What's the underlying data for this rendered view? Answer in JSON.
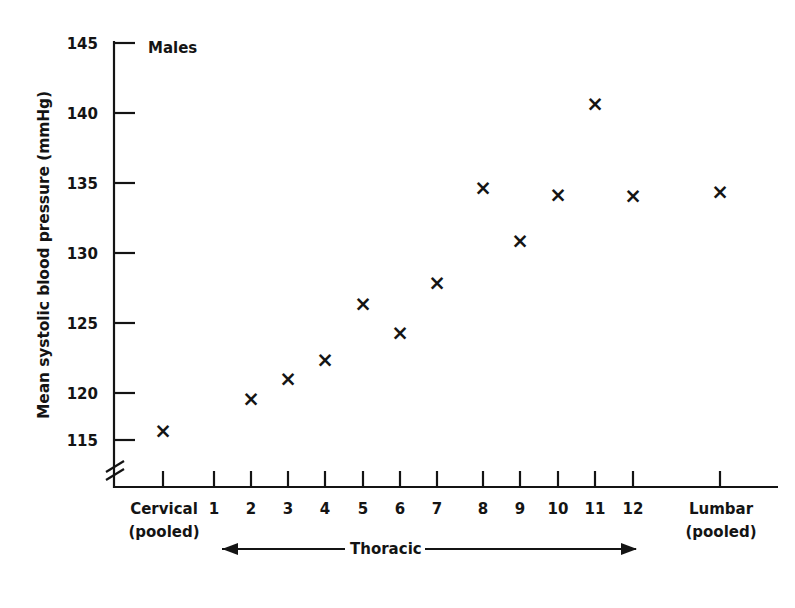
{
  "annotation": {
    "series_label": "Males"
  },
  "axes": {
    "y_title": "Mean systolic blood pressure (mmHg)",
    "y_ticks": [
      "115",
      "120",
      "125",
      "130",
      "135",
      "140",
      "145"
    ],
    "x_tick_labels": [
      "Cervical",
      "1",
      "2",
      "3",
      "4",
      "5",
      "6",
      "7",
      "8",
      "9",
      "10",
      "11",
      "12",
      "Lumbar"
    ],
    "x_tick_sublabels": [
      "(pooled)",
      "",
      "",
      "",
      "",
      "",
      "",
      "",
      "",
      "",
      "",
      "",
      "",
      "(pooled)"
    ],
    "group_label": "Thoracic",
    "has_y_axis_break": true
  },
  "chart_data": {
    "type": "scatter",
    "title": "",
    "subtitle": "",
    "xlabel": "",
    "ylabel": "Mean systolic blood pressure (mmHg)",
    "annotations": [
      "Males",
      "Thoracic"
    ],
    "legend_position": "none",
    "grid": false,
    "ylim": [
      115,
      145
    ],
    "y_ticks": [
      115,
      120,
      125,
      130,
      135,
      140,
      145
    ],
    "y_axis_break": true,
    "categories": [
      "Cervical (pooled)",
      "1",
      "2",
      "3",
      "4",
      "5",
      "6",
      "7",
      "8",
      "9",
      "10",
      "11",
      "12",
      "Lumbar (pooled)"
    ],
    "series": [
      {
        "name": "Males",
        "marker": "x",
        "values": [
          115.8,
          null,
          119.3,
          120.9,
          122.3,
          126.3,
          124.2,
          127.8,
          134.6,
          130.8,
          134.1,
          140.6,
          134.0,
          134.3
        ]
      }
    ],
    "points": [
      {
        "category": "Cervical (pooled)",
        "value": 115.8
      },
      {
        "category": "2",
        "value": 119.3
      },
      {
        "category": "3",
        "value": 120.9
      },
      {
        "category": "4",
        "value": 122.3
      },
      {
        "category": "5",
        "value": 126.3
      },
      {
        "category": "6",
        "value": 124.2
      },
      {
        "category": "7",
        "value": 127.8
      },
      {
        "category": "8",
        "value": 134.6
      },
      {
        "category": "9",
        "value": 130.8
      },
      {
        "category": "10",
        "value": 134.1
      },
      {
        "category": "11",
        "value": 140.6
      },
      {
        "category": "12",
        "value": 134.0
      },
      {
        "category": "Lumbar (pooled)",
        "value": 134.3
      }
    ]
  }
}
